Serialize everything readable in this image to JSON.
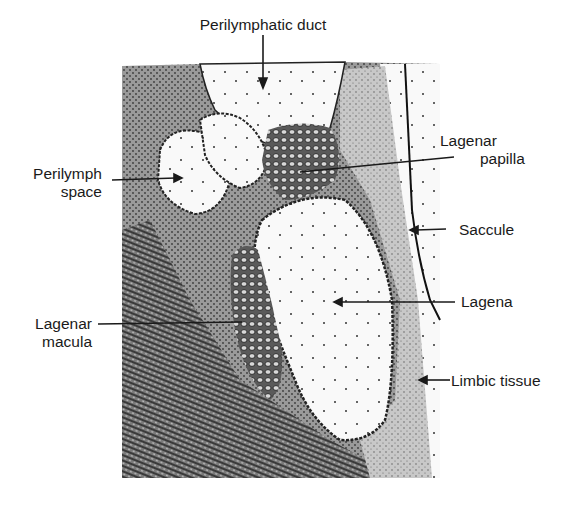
{
  "figure": {
    "type": "anatomical-illustration",
    "colors": {
      "ink": "#1a1a1a",
      "tissue_dark": "#4a4a4a",
      "tissue_mid": "#8c8c8c",
      "tissue_light": "#c4c4c4",
      "fluid_space": "#f7f7f7",
      "background": "#ffffff"
    }
  },
  "labels": {
    "perilymphatic_duct": "Perilymphatic duct",
    "perilymph_space_line1": "Perilymph",
    "perilymph_space_line2": "space",
    "lagenar_papilla_line1": "Lagenar",
    "lagenar_papilla_line2": "papilla",
    "saccule": "Saccule",
    "lagena": "Lagena",
    "lagenar_macula_line1": "Lagenar",
    "lagenar_macula_line2": "macula",
    "limbic_tissue": "Limbic tissue"
  }
}
